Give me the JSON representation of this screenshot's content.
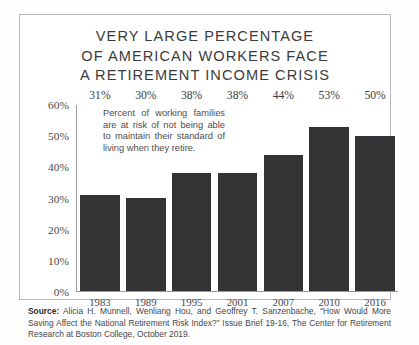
{
  "chart_data": {
    "type": "bar",
    "title": "VERY LARGE PERCENTAGE\nOF AMERICAN WORKERS FACE\nA RETIREMENT INCOME CRISIS",
    "categories": [
      "1983",
      "1989",
      "1995",
      "2001",
      "2007",
      "2010",
      "2016"
    ],
    "values": [
      31,
      30,
      38,
      38,
      44,
      53,
      50
    ],
    "value_labels": [
      "31%",
      "30%",
      "38%",
      "38%",
      "44%",
      "53%",
      "50%"
    ],
    "xlabel": "",
    "ylabel": "",
    "ylim": [
      0,
      60
    ],
    "ytick_values": [
      60,
      50,
      40,
      30,
      20,
      10,
      0
    ],
    "ytick_labels": [
      "60%",
      "50%",
      "40%",
      "30%",
      "20%",
      "10%",
      "0%"
    ],
    "grid": false,
    "legend": "none",
    "annotation": "Percent of working families are at risk of not being able to maintain their standard of living when they retire.",
    "bar_color": "#333335",
    "axis_color": "#9a9a9c"
  },
  "source": {
    "label": "Source:",
    "text": " Alicia H. Munnell, Wenliang Hou, and Geoffrey T. Sanzenbache, “How Would More Saving Affect the National Retirement Risk Index?”  Issue Brief 19-16, The Center for Retirement Research at Boston College, October 2019."
  }
}
